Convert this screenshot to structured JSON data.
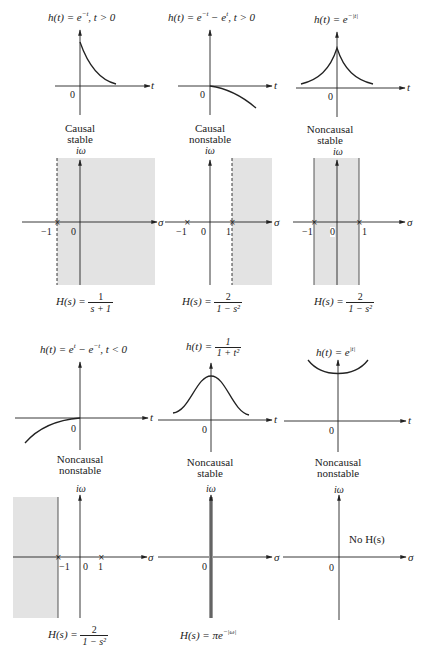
{
  "figure": {
    "axis_labels": {
      "time": "t",
      "real": "σ",
      "imag": "iω",
      "origin": "0"
    },
    "row1": [
      {
        "h_title_lhs": "h(t) = e",
        "h_title_exp": "−t",
        "h_title_rhs": ", t > 0",
        "class_line1": "Causal",
        "class_line2": "stable",
        "poles": [
          "−1"
        ],
        "roc": "Re(s) > −1",
        "hs_lhs": "H(s) =",
        "hs_num": "1",
        "hs_den": "s + 1"
      },
      {
        "h_title_lhs": "h(t) = e",
        "h_title_exp": "−t",
        "h_title_mid": " − e",
        "h_title_exp2": "t",
        "h_title_rhs": ", t > 0",
        "class_line1": "Causal",
        "class_line2": "nonstable",
        "poles": [
          "−1",
          "1"
        ],
        "roc": "Re(s) > 1",
        "hs_lhs": "H(s) =",
        "hs_num": "2",
        "hs_den": "1 − s²"
      },
      {
        "h_title_lhs": "h(t) = e",
        "h_title_exp": "−|t|",
        "class_line1": "Noncausal",
        "class_line2": "stable",
        "poles": [
          "−1",
          "1"
        ],
        "roc": "−1 < Re(s) < 1",
        "hs_lhs": "H(s) =",
        "hs_num": "2",
        "hs_den": "1 − s²"
      }
    ],
    "row2": [
      {
        "h_title_lhs": "h(t) = e",
        "h_title_exp": "t",
        "h_title_mid": " − e",
        "h_title_exp2": "−t",
        "h_title_rhs": ", t < 0",
        "class_line1": "Noncausal",
        "class_line2": "nonstable",
        "poles": [
          "−1",
          "1"
        ],
        "roc": "Re(s) < −1",
        "hs_lhs": "H(s) =",
        "hs_num": "2",
        "hs_den": "1 − s²"
      },
      {
        "h_title_lhs": "h(t) =",
        "h_title_num": "1",
        "h_title_den": "1 + t²",
        "class_line1": "Noncausal",
        "class_line2": "stable",
        "roc": "Re(s) = 0",
        "hs_text": "H(s) = πe",
        "hs_exp": "−|ω|"
      },
      {
        "h_title_lhs": "h(t) = e",
        "h_title_exp": "|t|",
        "class_line1": "Noncausal",
        "class_line2": "nonstable",
        "no_hs_text": "No H(s)"
      }
    ],
    "ticks": {
      "neg_one": "−1",
      "one": "1",
      "zero": "0"
    },
    "colors": {
      "ink": "#222222",
      "roc_fill": "#e3e3e3",
      "background": "#ffffff"
    }
  }
}
